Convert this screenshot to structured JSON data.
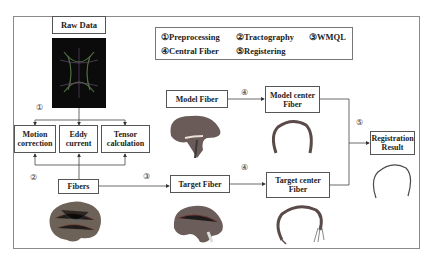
{
  "diagram": {
    "nodes": {
      "raw_data": "Raw Data",
      "motion_correction": [
        "Motion",
        "correction"
      ],
      "eddy_current": [
        "Eddy",
        "current"
      ],
      "tensor_calculation": [
        "Tensor",
        "calculation"
      ],
      "fibers": "Fibers",
      "model_fiber": "Model Fiber",
      "model_center_fiber": [
        "Model center",
        "Fiber"
      ],
      "target_fiber": "Target Fiber",
      "target_center_fiber": [
        "Target center",
        "Fiber"
      ],
      "registration_result": [
        "Registration",
        "Result"
      ]
    },
    "legend": {
      "item1": "①Preprocessing",
      "item2": "②Tractography",
      "item3": "③WMQL",
      "item4": "④Central Fiber",
      "item5": "⑤Registering"
    },
    "step_markers": {
      "preprocessing": "①",
      "tractography": "②",
      "wmql_fibers": "③",
      "central_model": "④",
      "central_target": "④",
      "registering": "⑤"
    },
    "images": {
      "raw_dti": "raw-dti-scan",
      "whole_brain_fibers": "whole-brain-tractography",
      "model_fiber_bundle": "model-fiber-bundle",
      "model_center_curve": "model-center-fiber-curve",
      "target_fiber_bundle": "target-fiber-bundle",
      "target_center_curve": "target-center-fiber-curve",
      "registration_curve": "registration-result-curve"
    },
    "edges": [
      [
        "raw_data",
        "motion_correction"
      ],
      [
        "raw_data",
        "eddy_current"
      ],
      [
        "raw_data",
        "tensor_calculation"
      ],
      [
        "fibers",
        "motion_correction"
      ],
      [
        "fibers",
        "eddy_current"
      ],
      [
        "fibers",
        "tensor_calculation"
      ],
      [
        "fibers",
        "target_fiber"
      ],
      [
        "model_fiber",
        "model_center_fiber"
      ],
      [
        "target_fiber",
        "target_center_fiber"
      ],
      [
        "model_center_fiber",
        "registration_result"
      ],
      [
        "target_center_fiber",
        "registration_result"
      ]
    ]
  }
}
